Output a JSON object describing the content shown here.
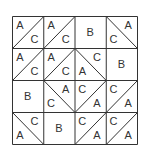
{
  "diagram": {
    "type": "quilt-block",
    "rows": 4,
    "cols": 4,
    "line_color": "#333333",
    "cells": [
      [
        {
          "kind": "diag",
          "dir": "/",
          "tl": "A",
          "br": "C"
        },
        {
          "kind": "diag",
          "dir": "/",
          "tl": "A",
          "br": "C"
        },
        {
          "kind": "solid",
          "label": "B"
        },
        {
          "kind": "diag",
          "dir": "\\",
          "tr": "A",
          "bl": "C"
        }
      ],
      [
        {
          "kind": "diag",
          "dir": "/",
          "tl": "A",
          "br": "C"
        },
        {
          "kind": "diag",
          "dir": "/",
          "tl": "A",
          "br": "C"
        },
        {
          "kind": "diag",
          "dir": "\\",
          "tr": "C",
          "bl": "A"
        },
        {
          "kind": "solid",
          "label": "B"
        }
      ],
      [
        {
          "kind": "solid",
          "label": "B"
        },
        {
          "kind": "diag",
          "dir": "\\",
          "tr": "A",
          "bl": "C"
        },
        {
          "kind": "diag",
          "dir": "/",
          "tl": "C",
          "br": "A"
        },
        {
          "kind": "diag",
          "dir": "/",
          "tl": "C",
          "br": "A"
        }
      ],
      [
        {
          "kind": "diag",
          "dir": "\\",
          "tr": "C",
          "bl": "A"
        },
        {
          "kind": "solid",
          "label": "B"
        },
        {
          "kind": "diag",
          "dir": "/",
          "tl": "C",
          "br": "A"
        },
        {
          "kind": "diag",
          "dir": "/",
          "tl": "C",
          "br": "A"
        }
      ]
    ]
  }
}
